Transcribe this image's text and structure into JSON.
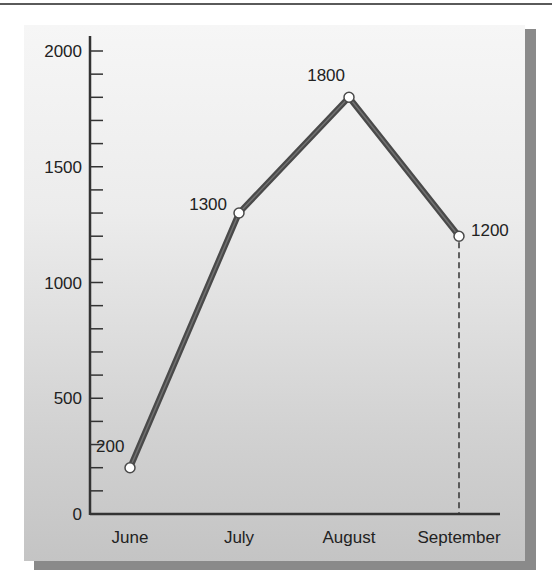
{
  "chart_data": {
    "type": "line",
    "title": "",
    "xlabel": "",
    "ylabel": "",
    "categories": [
      "June",
      "July",
      "August",
      "September"
    ],
    "series": [
      {
        "name": "",
        "values": [
          200,
          1300,
          1800,
          1200
        ]
      }
    ],
    "data_labels": [
      "200",
      "1300",
      "1800",
      "1200"
    ],
    "ylim": [
      0,
      2000
    ],
    "y_major_ticks": [
      0,
      500,
      1000,
      1500,
      2000
    ],
    "y_tick_labels": [
      "0",
      "500",
      "1000",
      "1500",
      "2000"
    ],
    "y_minor_tick_step": 100,
    "grid": false,
    "legend": "none",
    "annotations": [
      {
        "type": "dashed-drop-line",
        "at": "September",
        "value": 1200
      }
    ]
  },
  "colors": {
    "line": "#4a4a4a",
    "marker_fill": "#ffffff",
    "axis": "#333333",
    "panel_top": "#f6f6f6",
    "panel_bottom": "#c4c4c4",
    "shadow": "#8a8a8a"
  }
}
